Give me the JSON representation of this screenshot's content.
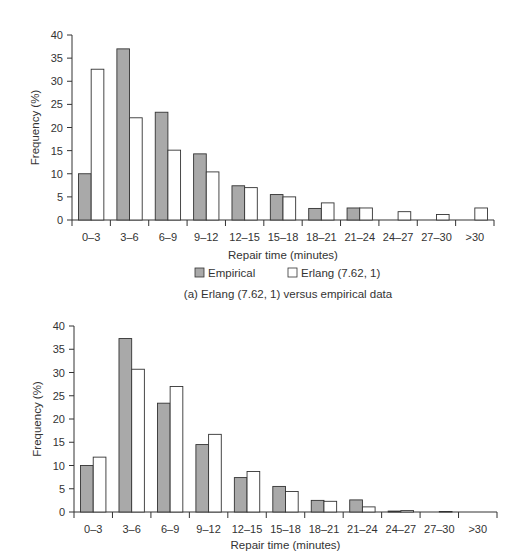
{
  "colors": {
    "empirical": "#a9a9a9",
    "erlang": "#ffffff",
    "stroke": "#333333"
  },
  "legend": {
    "empirical_label": "Empirical",
    "erlang_label": "Erlang (7.62, 1)"
  },
  "top_caption": "(a) Erlang (7.62, 1) versus empirical data",
  "chart_data": [
    {
      "type": "bar",
      "title": "(a) Erlang (7.62, 1) versus empirical data",
      "xlabel": "Repair time (minutes)",
      "ylabel": "Frequency (%)",
      "ylim": [
        0,
        40
      ],
      "yticks": [
        0,
        5,
        10,
        15,
        20,
        25,
        30,
        35,
        40
      ],
      "grid": false,
      "legend_position": "bottom",
      "categories": [
        "0–3",
        "3–6",
        "6–9",
        "9–12",
        "12–15",
        "15–18",
        "18–21",
        "21–24",
        "24–27",
        "27–30",
        ">30"
      ],
      "series": [
        {
          "name": "Empirical",
          "values": [
            10,
            37,
            23.3,
            14.3,
            7.4,
            5.5,
            2.5,
            2.6,
            0,
            0,
            0
          ]
        },
        {
          "name": "Erlang (7.62, 1)",
          "values": [
            32.6,
            22.1,
            15.1,
            10.4,
            7.0,
            5.0,
            3.7,
            2.6,
            1.8,
            1.2,
            2.6
          ]
        }
      ]
    },
    {
      "type": "bar",
      "title": "",
      "xlabel": "Repair time (minutes)",
      "ylabel": "Frequency (%)",
      "ylim": [
        0,
        40
      ],
      "yticks": [
        0,
        5,
        10,
        15,
        20,
        25,
        30,
        35,
        40
      ],
      "grid": false,
      "categories": [
        "0–3",
        "3–6",
        "6–9",
        "9–12",
        "12–15",
        "15–18",
        "18–21",
        "21–24",
        "24–27",
        "27–30",
        ">30"
      ],
      "series": [
        {
          "name": "Empirical",
          "values": [
            10,
            37.3,
            23.4,
            14.5,
            7.4,
            5.5,
            2.5,
            2.6,
            0.2,
            0,
            0
          ]
        },
        {
          "name": "Erlang",
          "values": [
            11.8,
            30.7,
            27.0,
            16.7,
            8.7,
            4.4,
            2.3,
            1.1,
            0.3,
            0.1,
            0.05
          ]
        }
      ]
    }
  ]
}
